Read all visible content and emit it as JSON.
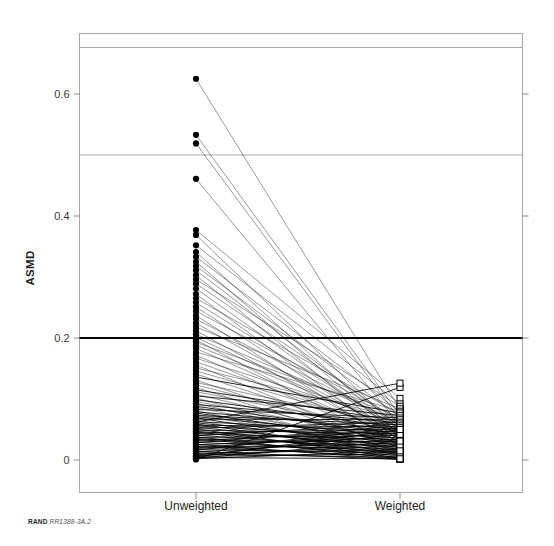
{
  "figure": {
    "credit_brand": "RAND",
    "credit_docid": "RR1388-3A.2",
    "title_fragment": ""
  },
  "chart_data": {
    "type": "line",
    "subtype": "slope-chart",
    "title": "",
    "xlabel": "",
    "ylabel": "ASMD",
    "categories": [
      "Unweighted",
      "Weighted"
    ],
    "x": [
      0,
      1
    ],
    "ylim": [
      -0.02,
      0.67
    ],
    "yticks": [
      0,
      0.2,
      0.4,
      0.6
    ],
    "ytick_labels": [
      "0",
      "0.2",
      "0.4",
      "0.6"
    ],
    "grid": false,
    "legend": null,
    "marker_left": "filled-circle",
    "marker_right": "open-square",
    "reference_lines": [
      {
        "value": 0.5,
        "style": "thin-gray",
        "color": "#a7a7a7"
      },
      {
        "value": 0.2,
        "style": "thick-black",
        "color": "#000000"
      }
    ],
    "series": [
      {
        "name": "v1",
        "values": [
          0.625,
          0.083
        ]
      },
      {
        "name": "v2",
        "values": [
          0.533,
          0.073
        ]
      },
      {
        "name": "v3",
        "values": [
          0.519,
          0.066
        ]
      },
      {
        "name": "v4",
        "values": [
          0.461,
          0.057
        ]
      },
      {
        "name": "v5",
        "values": [
          0.377,
          0.101
        ]
      },
      {
        "name": "v6",
        "values": [
          0.369,
          0.048
        ]
      },
      {
        "name": "v7",
        "values": [
          0.352,
          0.092
        ]
      },
      {
        "name": "v8",
        "values": [
          0.341,
          0.041
        ]
      },
      {
        "name": "v9",
        "values": [
          0.333,
          0.079
        ]
      },
      {
        "name": "v10",
        "values": [
          0.325,
          0.036
        ]
      },
      {
        "name": "v11",
        "values": [
          0.318,
          0.07
        ]
      },
      {
        "name": "v12",
        "values": [
          0.311,
          0.055
        ]
      },
      {
        "name": "v13",
        "values": [
          0.303,
          0.03
        ]
      },
      {
        "name": "v14",
        "values": [
          0.296,
          0.088
        ]
      },
      {
        "name": "v15",
        "values": [
          0.289,
          0.062
        ]
      },
      {
        "name": "v16",
        "values": [
          0.281,
          0.044
        ]
      },
      {
        "name": "v17",
        "values": [
          0.272,
          0.026
        ]
      },
      {
        "name": "v18",
        "values": [
          0.265,
          0.075
        ]
      },
      {
        "name": "v19",
        "values": [
          0.258,
          0.051
        ]
      },
      {
        "name": "v20",
        "values": [
          0.251,
          0.033
        ]
      },
      {
        "name": "v21",
        "values": [
          0.244,
          0.067
        ]
      },
      {
        "name": "v22",
        "values": [
          0.237,
          0.022
        ]
      },
      {
        "name": "v23",
        "values": [
          0.231,
          0.058
        ]
      },
      {
        "name": "v24",
        "values": [
          0.224,
          0.04
        ]
      },
      {
        "name": "v25",
        "values": [
          0.218,
          0.084
        ]
      },
      {
        "name": "v26",
        "values": [
          0.212,
          0.029
        ]
      },
      {
        "name": "v27",
        "values": [
          0.206,
          0.063
        ]
      },
      {
        "name": "v28",
        "values": [
          0.201,
          0.046
        ]
      },
      {
        "name": "v29",
        "values": [
          0.197,
          0.018
        ]
      },
      {
        "name": "v30",
        "values": [
          0.193,
          0.071
        ]
      },
      {
        "name": "v31",
        "values": [
          0.188,
          0.052
        ]
      },
      {
        "name": "v32",
        "values": [
          0.183,
          0.035
        ]
      },
      {
        "name": "v33",
        "values": [
          0.177,
          0.08
        ]
      },
      {
        "name": "v34",
        "values": [
          0.172,
          0.024
        ]
      },
      {
        "name": "v35",
        "values": [
          0.167,
          0.06
        ]
      },
      {
        "name": "v36",
        "values": [
          0.161,
          0.043
        ]
      },
      {
        "name": "v37",
        "values": [
          0.156,
          0.015
        ]
      },
      {
        "name": "v38",
        "values": [
          0.151,
          0.068
        ]
      },
      {
        "name": "v39",
        "values": [
          0.146,
          0.049
        ]
      },
      {
        "name": "v40",
        "values": [
          0.141,
          0.031
        ]
      },
      {
        "name": "v41",
        "values": [
          0.136,
          0.077
        ]
      },
      {
        "name": "v42",
        "values": [
          0.131,
          0.02
        ]
      },
      {
        "name": "v43",
        "values": [
          0.127,
          0.056
        ]
      },
      {
        "name": "v44",
        "values": [
          0.123,
          0.038
        ]
      },
      {
        "name": "v45",
        "values": [
          0.119,
          0.012
        ]
      },
      {
        "name": "v46",
        "values": [
          0.115,
          0.064
        ]
      },
      {
        "name": "v47",
        "values": [
          0.112,
          0.047
        ]
      },
      {
        "name": "v48",
        "values": [
          0.108,
          0.027
        ]
      },
      {
        "name": "v49",
        "values": [
          0.105,
          0.073
        ]
      },
      {
        "name": "v50",
        "values": [
          0.102,
          0.009
        ]
      },
      {
        "name": "v51",
        "values": [
          0.099,
          0.053
        ]
      },
      {
        "name": "v52",
        "values": [
          0.096,
          0.034
        ]
      },
      {
        "name": "v53",
        "values": [
          0.093,
          0.016
        ]
      },
      {
        "name": "v54",
        "values": [
          0.091,
          0.061
        ]
      },
      {
        "name": "v55",
        "values": [
          0.088,
          0.042
        ]
      },
      {
        "name": "v56",
        "values": [
          0.086,
          0.023
        ]
      },
      {
        "name": "v57",
        "values": [
          0.083,
          0.069
        ]
      },
      {
        "name": "v58",
        "values": [
          0.081,
          0.007
        ]
      },
      {
        "name": "v59",
        "values": [
          0.079,
          0.05
        ]
      },
      {
        "name": "v60",
        "values": [
          0.077,
          0.03
        ]
      },
      {
        "name": "v61",
        "values": [
          0.075,
          0.013
        ]
      },
      {
        "name": "v62",
        "values": [
          0.073,
          0.058
        ]
      },
      {
        "name": "v63",
        "values": [
          0.071,
          0.039
        ]
      },
      {
        "name": "v64",
        "values": [
          0.069,
          0.02
        ]
      },
      {
        "name": "v65",
        "values": [
          0.067,
          0.066
        ]
      },
      {
        "name": "v66",
        "values": [
          0.065,
          0.005
        ]
      },
      {
        "name": "v67",
        "values": [
          0.063,
          0.046
        ]
      },
      {
        "name": "v68",
        "values": [
          0.061,
          0.028
        ]
      },
      {
        "name": "v69",
        "values": [
          0.059,
          0.011
        ]
      },
      {
        "name": "v70",
        "values": [
          0.057,
          0.054
        ]
      },
      {
        "name": "v71",
        "values": [
          0.056,
          0.036
        ]
      },
      {
        "name": "v72",
        "values": [
          0.054,
          0.018
        ]
      },
      {
        "name": "v73",
        "values": [
          0.052,
          0.062
        ]
      },
      {
        "name": "v74",
        "values": [
          0.051,
          0.003
        ]
      },
      {
        "name": "v75",
        "values": [
          0.049,
          0.043
        ]
      },
      {
        "name": "v76",
        "values": [
          0.047,
          0.025
        ]
      },
      {
        "name": "v77",
        "values": [
          0.046,
          0.009
        ]
      },
      {
        "name": "v78",
        "values": [
          0.044,
          0.051
        ]
      },
      {
        "name": "v79",
        "values": [
          0.043,
          0.033
        ]
      },
      {
        "name": "v80",
        "values": [
          0.041,
          0.016
        ]
      },
      {
        "name": "v81",
        "values": [
          0.04,
          0.059
        ]
      },
      {
        "name": "v82",
        "values": [
          0.038,
          0.002
        ]
      },
      {
        "name": "v83",
        "values": [
          0.037,
          0.04
        ]
      },
      {
        "name": "v84",
        "values": [
          0.035,
          0.022
        ]
      },
      {
        "name": "v85",
        "values": [
          0.034,
          0.007
        ]
      },
      {
        "name": "v86",
        "values": [
          0.032,
          0.048
        ]
      },
      {
        "name": "v87",
        "values": [
          0.031,
          0.03
        ]
      },
      {
        "name": "v88",
        "values": [
          0.029,
          0.014
        ]
      },
      {
        "name": "v89",
        "values": [
          0.028,
          0.056
        ]
      },
      {
        "name": "v90",
        "values": [
          0.026,
          0.001
        ]
      },
      {
        "name": "v91",
        "values": [
          0.025,
          0.037
        ]
      },
      {
        "name": "v92",
        "values": [
          0.023,
          0.019
        ]
      },
      {
        "name": "v93",
        "values": [
          0.022,
          0.005
        ]
      },
      {
        "name": "v94",
        "values": [
          0.02,
          0.045
        ]
      },
      {
        "name": "v95",
        "values": [
          0.019,
          0.027
        ]
      },
      {
        "name": "v96",
        "values": [
          0.017,
          0.012
        ]
      },
      {
        "name": "v97",
        "values": [
          0.016,
          0.053
        ]
      },
      {
        "name": "v98",
        "values": [
          0.014,
          0.001
        ]
      },
      {
        "name": "v99",
        "values": [
          0.013,
          0.034
        ]
      },
      {
        "name": "v100",
        "values": [
          0.011,
          0.017
        ]
      },
      {
        "name": "v101",
        "values": [
          0.01,
          0.004
        ]
      },
      {
        "name": "v102",
        "values": [
          0.008,
          0.042
        ]
      },
      {
        "name": "v103",
        "values": [
          0.007,
          0.024
        ]
      },
      {
        "name": "v104",
        "values": [
          0.006,
          0.01
        ]
      },
      {
        "name": "v105",
        "values": [
          0.005,
          0.05
        ]
      },
      {
        "name": "v106",
        "values": [
          0.004,
          0.002
        ]
      },
      {
        "name": "v107",
        "values": [
          0.003,
          0.031
        ]
      },
      {
        "name": "v108",
        "values": [
          0.002,
          0.015
        ]
      },
      {
        "name": "v109",
        "values": [
          0.001,
          0.119
        ]
      },
      {
        "name": "v110",
        "values": [
          0.062,
          0.126
        ]
      }
    ]
  }
}
